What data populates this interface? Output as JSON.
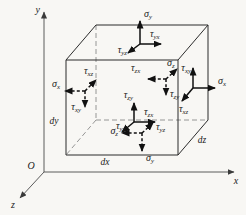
{
  "figure": {
    "background": "#f8f7f4",
    "ink": "#1a1a1a"
  },
  "axes": {
    "x": "x",
    "y": "y",
    "z": "z",
    "origin": "O"
  },
  "dims": {
    "dx": "dx",
    "dy": "dy",
    "dz": "dz"
  },
  "stress": {
    "top": {
      "style": "solid",
      "normal": {
        "sym": "σ",
        "sub": "y"
      },
      "shear_a": {
        "sym": "τ",
        "sub": "yx"
      },
      "shear_b": {
        "sym": "τ",
        "sub": "yz"
      }
    },
    "right": {
      "style": "solid",
      "normal": {
        "sym": "σ",
        "sub": "x"
      },
      "shear_a": {
        "sym": "τ",
        "sub": "xy"
      },
      "shear_b": {
        "sym": "τ",
        "sub": "xz"
      }
    },
    "front": {
      "style": "solid",
      "normal": {
        "sym": "σ",
        "sub": "z"
      },
      "shear_a": {
        "sym": "τ",
        "sub": "zy"
      },
      "shear_b": {
        "sym": "τ",
        "sub": "zx"
      }
    },
    "left": {
      "style": "dashed",
      "normal": {
        "sym": "σ",
        "sub": "x"
      },
      "shear_a": {
        "sym": "τ",
        "sub": "xz"
      },
      "shear_b": {
        "sym": "τ",
        "sub": "xy"
      }
    },
    "back": {
      "style": "dashed",
      "normal": {
        "sym": "σ",
        "sub": "z"
      },
      "shear_a": {
        "sym": "τ",
        "sub": "zx"
      },
      "shear_b": {
        "sym": "τ",
        "sub": "zy"
      }
    },
    "bottom": {
      "style": "dashed",
      "normal": {
        "sym": "σ",
        "sub": "y"
      },
      "shear_a": {
        "sym": "τ",
        "sub": "yx"
      },
      "shear_b": {
        "sym": "τ",
        "sub": "yz"
      }
    }
  }
}
